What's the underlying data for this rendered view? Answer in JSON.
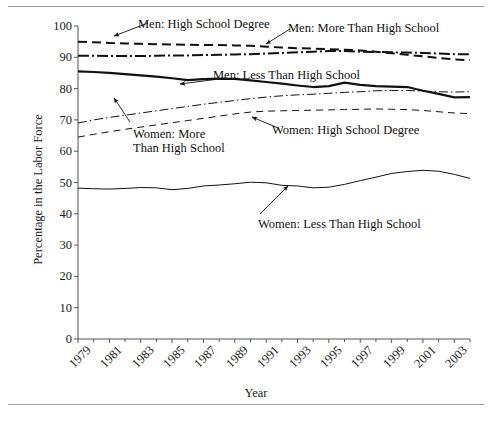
{
  "figure": {
    "rules": [
      "top-rule",
      "bottom-rule"
    ]
  },
  "chart_data": {
    "type": "line",
    "title": "",
    "xlabel": "Year",
    "ylabel": "Percentage in the Labor Force",
    "xlim": [
      1979,
      2004
    ],
    "ylim": [
      0,
      100
    ],
    "grid": false,
    "legend": "inline-annotations",
    "xtick_labels": [
      "1979",
      "1981",
      "1983",
      "1985",
      "1987",
      "1989",
      "1991",
      "1993",
      "1995",
      "1997",
      "1999",
      "2001",
      "2003"
    ],
    "ytick_labels": [
      "0",
      "10",
      "20",
      "30",
      "40",
      "50",
      "60",
      "70",
      "80",
      "90",
      "100"
    ],
    "x": [
      1979,
      1980,
      1981,
      1982,
      1983,
      1984,
      1985,
      1986,
      1987,
      1988,
      1989,
      1990,
      1991,
      1992,
      1993,
      1994,
      1995,
      1996,
      1997,
      1998,
      1999,
      2000,
      2001,
      2002,
      2003,
      2004
    ],
    "series": [
      {
        "name": "Men: High School Degree",
        "style": "dashed",
        "width": 2.0,
        "color": "#111111",
        "values": [
          95.0,
          94.8,
          94.6,
          94.4,
          94.3,
          94.2,
          94.1,
          94.0,
          93.9,
          93.9,
          93.8,
          93.7,
          93.4,
          93.1,
          92.9,
          92.8,
          92.6,
          92.4,
          92.2,
          91.8,
          91.3,
          90.8,
          90.3,
          89.8,
          89.3,
          89.1
        ]
      },
      {
        "name": "Men: More Than High School",
        "style": "dash-dot",
        "width": 2.0,
        "color": "#111111",
        "values": [
          90.5,
          90.5,
          90.4,
          90.4,
          90.4,
          90.5,
          90.6,
          90.6,
          90.7,
          90.8,
          90.9,
          91.0,
          91.2,
          91.4,
          91.6,
          91.8,
          92.0,
          92.0,
          91.8,
          91.7,
          91.6,
          91.5,
          91.4,
          91.2,
          91.0,
          91.0
        ]
      },
      {
        "name": "Men: Less Than High School",
        "style": "solid",
        "width": 2.2,
        "color": "#111111",
        "values": [
          85.5,
          85.3,
          85.0,
          84.6,
          84.2,
          83.8,
          83.3,
          82.7,
          83.0,
          83.2,
          83.1,
          82.6,
          82.1,
          81.6,
          81.0,
          80.5,
          80.8,
          81.9,
          81.2,
          80.8,
          80.6,
          80.5,
          79.3,
          78.3,
          77.2,
          77.3
        ]
      },
      {
        "name": "Women: More Than High School",
        "style": "dash-dot-thin",
        "width": 1.0,
        "color": "#111111",
        "values": [
          69.0,
          70.0,
          70.8,
          71.5,
          72.2,
          72.9,
          73.6,
          74.3,
          75.0,
          75.6,
          76.2,
          76.8,
          77.3,
          77.7,
          78.0,
          78.2,
          78.5,
          78.8,
          79.0,
          79.3,
          79.4,
          79.4,
          79.2,
          79.0,
          78.9,
          79.0
        ]
      },
      {
        "name": "Women: High School Degree",
        "style": "dashed-thin",
        "width": 1.0,
        "color": "#111111",
        "values": [
          64.5,
          65.4,
          66.2,
          67.0,
          67.7,
          68.4,
          69.1,
          69.8,
          70.5,
          71.2,
          71.9,
          72.5,
          72.8,
          72.9,
          73.0,
          73.1,
          73.2,
          73.3,
          73.4,
          73.5,
          73.4,
          73.3,
          73.0,
          72.6,
          72.2,
          72.0
        ]
      },
      {
        "name": "Women: Less Than High School",
        "style": "solid-thin",
        "width": 1.0,
        "color": "#111111",
        "values": [
          48.2,
          48.0,
          47.9,
          48.1,
          48.4,
          48.3,
          47.7,
          48.1,
          48.9,
          49.2,
          49.6,
          50.1,
          49.9,
          49.1,
          48.9,
          48.3,
          48.5,
          49.4,
          50.6,
          51.7,
          52.9,
          53.5,
          53.9,
          53.6,
          52.6,
          51.3
        ]
      }
    ]
  },
  "annotations": [
    {
      "id": "ann-men-hs-degree",
      "text": "Men: High School Degree"
    },
    {
      "id": "ann-men-more-than-hs",
      "text": "Men: More Than High School"
    },
    {
      "id": "ann-men-less-than-hs",
      "text": "Men: Less Than High School"
    },
    {
      "id": "ann-women-more-than-hs",
      "line1": "Women: More",
      "line2": "Than High School"
    },
    {
      "id": "ann-women-hs-degree",
      "text": "Women: High School Degree"
    },
    {
      "id": "ann-women-less-than-hs",
      "text": "Women: Less Than High School"
    }
  ]
}
